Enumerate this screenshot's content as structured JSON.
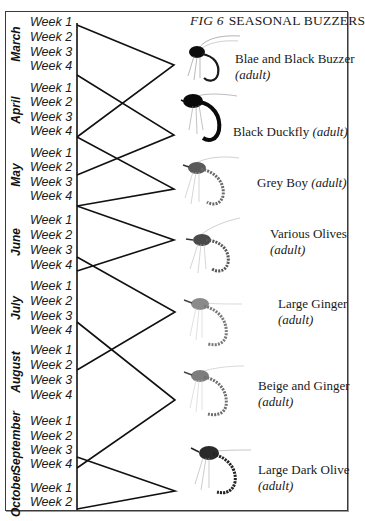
{
  "figure": {
    "number": "FIG 6",
    "title": "SEASONAL BUZZERS"
  },
  "months": [
    {
      "name": "March",
      "weeks": [
        "Week 1",
        "Week 2",
        "Week 3",
        "Week 4"
      ]
    },
    {
      "name": "April",
      "weeks": [
        "Week 1",
        "Week 2",
        "Week 3",
        "Week 4"
      ]
    },
    {
      "name": "May",
      "weeks": [
        "Week 1",
        "Week 2",
        "Week 3",
        "Week 4"
      ]
    },
    {
      "name": "June",
      "weeks": [
        "Week 1",
        "Week 2",
        "Week 3",
        "Week 4"
      ]
    },
    {
      "name": "July",
      "weeks": [
        "Week 1",
        "Week 2",
        "Week 3",
        "Week 4"
      ]
    },
    {
      "name": "August",
      "weeks": [
        "Week 1",
        "Week 2",
        "Week 3",
        "Week 4"
      ]
    },
    {
      "name": "September",
      "weeks": [
        "Week 1",
        "Week 2",
        "Week 3",
        "Week 4"
      ]
    },
    {
      "name": "October",
      "weeks": [
        "Week 1",
        "Week 2"
      ]
    }
  ],
  "flies": [
    {
      "name": "Blae and Black Buzzer",
      "qualifier": "(adult)",
      "season_start": "March Week 1",
      "season_end": "April Week 4",
      "body_color": "#111111"
    },
    {
      "name": "Black Duckfly",
      "qualifier": "(adult)",
      "season_start": "March Week 4",
      "season_end": "May Week 3",
      "body_color": "#0c0c0c"
    },
    {
      "name": "Grey Boy",
      "qualifier": "(adult)",
      "season_start": "April Week 4",
      "season_end": "June Week 1",
      "body_color": "#6b6b6b"
    },
    {
      "name": "Various Olives",
      "qualifier": "(adult)",
      "season_start": "June Week 1",
      "season_end": "July Week 3",
      "body_color": "#5a5a5a"
    },
    {
      "name": "Large Ginger",
      "qualifier": "(adult)",
      "season_start": "July Week 3",
      "season_end": "August Week 2",
      "body_color": "#8a8a8a"
    },
    {
      "name": "Beige and Ginger",
      "qualifier": "(adult)",
      "season_start": "July Week 4",
      "season_end": "September Week 4",
      "body_color": "#7d7d7d"
    },
    {
      "name": "Large Dark Olive",
      "qualifier": "(adult)",
      "season_start": "September Week 3",
      "season_end": "October Week 2",
      "body_color": "#2a2a2a"
    }
  ]
}
